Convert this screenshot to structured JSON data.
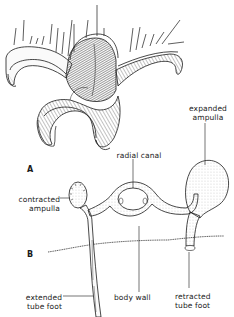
{
  "figure": {
    "panels": [
      {
        "id": "A",
        "label": "A",
        "description": "starfish arm tip with tube feet"
      },
      {
        "id": "B",
        "label": "B",
        "description": "water vascular system cross-section"
      }
    ],
    "labels": {
      "expanded_ampulla_line1": "expanded",
      "expanded_ampulla_line2": "ampulla",
      "radial_canal": "radial canal",
      "contracted_ampulla_line1": "contracted",
      "contracted_ampulla_line2": "ampulla",
      "body_wall": "body wall",
      "extended_tube_foot_line1": "extended",
      "extended_tube_foot_line2": "tube foot",
      "retracted_tube_foot_line1": "retracted",
      "retracted_tube_foot_line2": "tube foot"
    },
    "colors": {
      "ink": "#1a1a1a",
      "background": "#ffffff",
      "shade": "#555555"
    }
  }
}
